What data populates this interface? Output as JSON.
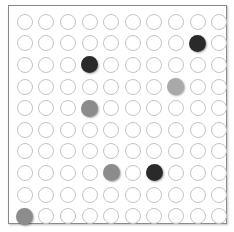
{
  "board": {
    "rows": 10,
    "cols": 10,
    "colors": {
      "black": "#2a2a2a",
      "grey": "#8c8c8c",
      "light_grey": "#a9a9a9",
      "empty_border": "#c4c4c4",
      "frame": "#8a8a8a"
    },
    "stones": [
      {
        "row": 2,
        "col": 9,
        "color": "black"
      },
      {
        "row": 3,
        "col": 4,
        "color": "black"
      },
      {
        "row": 4,
        "col": 8,
        "color": "light_grey"
      },
      {
        "row": 5,
        "col": 4,
        "color": "grey"
      },
      {
        "row": 8,
        "col": 5,
        "color": "grey"
      },
      {
        "row": 8,
        "col": 7,
        "color": "black"
      },
      {
        "row": 10,
        "col": 1,
        "color": "grey"
      }
    ]
  }
}
